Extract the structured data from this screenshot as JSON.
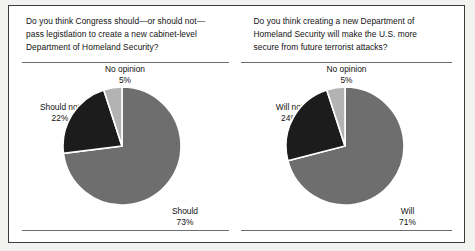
{
  "figure": {
    "background_color": "#f2f2f0",
    "frame_color": "#3a3a3a",
    "rule_color": "#6d6d6d"
  },
  "colors": {
    "primary_slice": "#6e6e6e",
    "negative_slice": "#1c1c1c",
    "no_opinion_slice": "#b3b3b3",
    "slice_outline": "#ffffff",
    "text": "#111111"
  },
  "panels": [
    {
      "id": "congress-legislation",
      "question_lines": [
        "Do  you think Congress should—or should not—",
        "pass legistlation to create a new cabinet-level",
        "Department of Homeland Security?"
      ],
      "chart_data": {
        "type": "pie",
        "title": "Do  you think Congress should—or should not—pass legistlation to create a new cabinet-level Department of Homeland Security?",
        "categories": [
          "Should",
          "Should not",
          "No opinion"
        ],
        "values": [
          73,
          22,
          5
        ],
        "value_labels": [
          "73%",
          "22%",
          "5%"
        ],
        "units": "percent",
        "start_angle_deg": 0,
        "direction": "clockwise",
        "colors": [
          "#6e6e6e",
          "#1c1c1c",
          "#b3b3b3"
        ],
        "legend": "none",
        "labels_position": "outside"
      },
      "labels": {
        "no_opinion": {
          "name": "No opinion",
          "pct": "5%"
        },
        "negative": {
          "name": "Should not",
          "pct": "22%"
        },
        "positive": {
          "name": "Should",
          "pct": "73%"
        }
      }
    },
    {
      "id": "more-secure",
      "question_lines": [
        "Do  you think creating a new Department of",
        "Homeland Security will make the U.S. more",
        "secure from future terrorist attacks?"
      ],
      "chart_data": {
        "type": "pie",
        "title": "Do  you think creating a new Department of Homeland Security will make the U.S. more secure from future terrorist attacks?",
        "categories": [
          "Will",
          "Will not",
          "No opinion"
        ],
        "values": [
          71,
          24,
          5
        ],
        "value_labels": [
          "71%",
          "24%",
          "5%"
        ],
        "units": "percent",
        "start_angle_deg": 0,
        "direction": "clockwise",
        "colors": [
          "#6e6e6e",
          "#1c1c1c",
          "#b3b3b3"
        ],
        "legend": "none",
        "labels_position": "outside"
      },
      "labels": {
        "no_opinion": {
          "name": "No opinion",
          "pct": "5%"
        },
        "negative": {
          "name": "Will not",
          "pct": "24%"
        },
        "positive": {
          "name": "Will",
          "pct": "71%"
        }
      }
    }
  ]
}
